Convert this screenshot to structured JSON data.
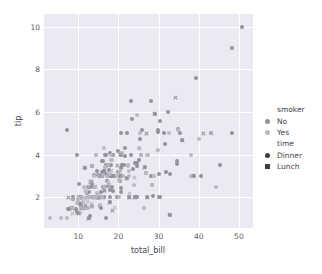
{
  "chart_data": {
    "type": "scatter",
    "title": "",
    "xlabel": "total_bill",
    "ylabel": "tip",
    "xlim": [
      1.5,
      53.5
    ],
    "ylim": [
      0.55,
      10.6
    ],
    "xticks": [
      10,
      20,
      30,
      40,
      50
    ],
    "yticks": [
      2,
      4,
      6,
      8,
      10
    ],
    "grid": true,
    "legend_position": "right",
    "hue": "smoker",
    "style": "time",
    "colors": {
      "No": "#92929f",
      "Yes": "#b9b9c4",
      "marker_dark": "#3d3d46",
      "panel_background": "#eaeaf2",
      "grid_line": "#ffffff",
      "text": "#44444c"
    },
    "legend": {
      "groups": [
        {
          "title": "smoker",
          "entries": [
            {
              "label": "No",
              "marker": "circle",
              "color": "#92929f"
            },
            {
              "label": "Yes",
              "marker": "circle",
              "color": "#b9b9c4"
            }
          ]
        },
        {
          "title": "time",
          "entries": [
            {
              "label": "Dinner",
              "marker": "circle",
              "color": "#3d3d46"
            },
            {
              "label": "Lunch",
              "marker": "x",
              "color": "#3d3d46"
            }
          ]
        }
      ]
    },
    "series": [
      {
        "name": "No / Dinner",
        "smoker": "No",
        "time": "Dinner",
        "marker": "circle",
        "color": "#92929f",
        "points": [
          [
            16.99,
            1.01
          ],
          [
            10.34,
            1.66
          ],
          [
            21.01,
            3.5
          ],
          [
            23.68,
            3.31
          ],
          [
            24.59,
            3.61
          ],
          [
            25.29,
            4.71
          ],
          [
            8.77,
            2.0
          ],
          [
            26.88,
            3.12
          ],
          [
            15.04,
            1.96
          ],
          [
            14.78,
            3.23
          ],
          [
            10.27,
            1.71
          ],
          [
            35.26,
            5.0
          ],
          [
            15.42,
            1.57
          ],
          [
            18.43,
            3.0
          ],
          [
            14.83,
            3.02
          ],
          [
            21.58,
            3.92
          ],
          [
            10.33,
            1.67
          ],
          [
            16.29,
            3.71
          ],
          [
            16.97,
            3.5
          ],
          [
            20.65,
            3.35
          ],
          [
            17.92,
            4.08
          ],
          [
            20.29,
            2.75
          ],
          [
            15.77,
            2.23
          ],
          [
            39.42,
            7.58
          ],
          [
            19.82,
            3.18
          ],
          [
            17.81,
            2.34
          ],
          [
            13.37,
            2.0
          ],
          [
            12.69,
            2.0
          ],
          [
            21.7,
            4.3
          ],
          [
            9.55,
            1.45
          ],
          [
            18.35,
            2.5
          ],
          [
            15.06,
            3.0
          ],
          [
            20.69,
            2.45
          ],
          [
            17.78,
            3.27
          ],
          [
            24.06,
            3.6
          ],
          [
            16.31,
            2.0
          ],
          [
            16.93,
            3.07
          ],
          [
            18.69,
            2.31
          ],
          [
            31.27,
            5.0
          ],
          [
            16.04,
            3.71
          ],
          [
            17.46,
            2.54
          ],
          [
            13.94,
            3.06
          ],
          [
            9.68,
            1.32
          ],
          [
            30.4,
            5.6
          ],
          [
            18.29,
            3.0
          ],
          [
            22.23,
            5.0
          ],
          [
            32.4,
            6.0
          ],
          [
            28.55,
            2.05
          ],
          [
            18.04,
            3.0
          ],
          [
            12.54,
            2.5
          ],
          [
            10.29,
            2.6
          ],
          [
            34.81,
            5.2
          ],
          [
            25.71,
            4.0
          ],
          [
            17.31,
            3.5
          ],
          [
            29.93,
            5.07
          ],
          [
            14.07,
            2.5
          ],
          [
            13.13,
            2.0
          ],
          [
            17.26,
            2.74
          ],
          [
            24.55,
            2.0
          ],
          [
            19.77,
            2.0
          ],
          [
            29.85,
            5.14
          ],
          [
            48.17,
            5.0
          ],
          [
            25.0,
            3.75
          ],
          [
            13.39,
            2.61
          ],
          [
            16.49,
            2.0
          ],
          [
            21.5,
            3.5
          ],
          [
            12.66,
            2.5
          ],
          [
            16.21,
            2.0
          ],
          [
            13.81,
            2.0
          ],
          [
            17.51,
            3.0
          ],
          [
            24.52,
            3.48
          ],
          [
            20.76,
            2.24
          ],
          [
            31.71,
            4.5
          ],
          [
            10.59,
            1.61
          ],
          [
            10.63,
            2.0
          ],
          [
            50.81,
            10.0
          ],
          [
            15.81,
            3.16
          ],
          [
            7.25,
            5.15
          ],
          [
            31.85,
            3.18
          ],
          [
            16.82,
            4.0
          ],
          [
            32.9,
            3.11
          ],
          [
            17.89,
            2.0
          ],
          [
            14.48,
            2.0
          ],
          [
            9.6,
            4.0
          ],
          [
            34.63,
            3.55
          ],
          [
            34.65,
            3.68
          ],
          [
            23.33,
            5.65
          ],
          [
            45.35,
            3.5
          ],
          [
            23.17,
            6.5
          ],
          [
            40.55,
            3.0
          ],
          [
            20.69,
            5.0
          ],
          [
            20.9,
            3.5
          ],
          [
            30.46,
            2.0
          ],
          [
            18.15,
            3.5
          ],
          [
            23.1,
            4.0
          ],
          [
            15.69,
            1.5
          ],
          [
            19.81,
            4.19
          ],
          [
            28.44,
            2.56
          ],
          [
            15.48,
            2.02
          ],
          [
            16.58,
            4.0
          ],
          [
            7.56,
            1.44
          ],
          [
            10.34,
            2.0
          ],
          [
            43.11,
            5.0
          ],
          [
            13.0,
            2.0
          ],
          [
            13.51,
            2.0
          ],
          [
            18.71,
            4.0
          ],
          [
            12.74,
            2.01
          ],
          [
            13.0,
            2.0
          ],
          [
            16.4,
            2.5
          ],
          [
            20.53,
            4.0
          ],
          [
            16.47,
            3.23
          ],
          [
            26.59,
            3.41
          ],
          [
            38.73,
            3.0
          ],
          [
            24.27,
            2.03
          ],
          [
            12.76,
            2.23
          ],
          [
            30.06,
            2.0
          ],
          [
            25.89,
            5.16
          ],
          [
            48.33,
            9.0
          ],
          [
            13.27,
            2.5
          ],
          [
            28.17,
            6.5
          ],
          [
            12.9,
            1.1
          ],
          [
            28.15,
            3.0
          ],
          [
            11.59,
            1.5
          ],
          [
            7.74,
            1.44
          ],
          [
            30.14,
            3.09
          ],
          [
            12.16,
            2.2
          ],
          [
            13.42,
            3.48
          ],
          [
            8.58,
            1.92
          ],
          [
            15.98,
            3.0
          ],
          [
            13.42,
            1.58
          ],
          [
            16.27,
            2.5
          ],
          [
            10.09,
            2.0
          ],
          [
            20.45,
            3.0
          ],
          [
            13.28,
            2.72
          ],
          [
            22.12,
            2.88
          ],
          [
            24.01,
            2.0
          ],
          [
            15.69,
            3.0
          ],
          [
            11.61,
            3.39
          ],
          [
            10.77,
            1.47
          ],
          [
            15.53,
            3.0
          ],
          [
            10.07,
            1.25
          ],
          [
            12.6,
            1.0
          ],
          [
            32.83,
            1.17
          ],
          [
            35.83,
            4.67
          ],
          [
            29.03,
            5.92
          ],
          [
            27.18,
            2.0
          ],
          [
            22.67,
            2.0
          ],
          [
            17.82,
            1.75
          ],
          [
            18.78,
            3.0
          ]
        ]
      },
      {
        "name": "Yes / Dinner",
        "smoker": "Yes",
        "time": "Dinner",
        "marker": "circle",
        "color": "#b9b9c4",
        "points": [
          [
            38.01,
            3.0
          ],
          [
            11.24,
            1.76
          ],
          [
            20.29,
            3.21
          ],
          [
            13.81,
            2.0
          ],
          [
            11.02,
            1.98
          ],
          [
            18.29,
            3.76
          ],
          [
            17.59,
            2.64
          ],
          [
            20.08,
            3.15
          ],
          [
            16.45,
            2.47
          ],
          [
            3.07,
            1.0
          ],
          [
            20.23,
            2.01
          ],
          [
            15.01,
            2.09
          ],
          [
            12.02,
            1.97
          ],
          [
            17.07,
            3.0
          ],
          [
            26.86,
            3.14
          ],
          [
            25.28,
            5.0
          ],
          [
            14.73,
            2.2
          ],
          [
            10.51,
            1.25
          ],
          [
            17.92,
            3.08
          ],
          [
            27.2,
            4.0
          ],
          [
            22.76,
            3.0
          ],
          [
            17.29,
            2.71
          ],
          [
            19.44,
            3.0
          ],
          [
            16.66,
            3.4
          ],
          [
            10.07,
            1.83
          ],
          [
            32.68,
            5.0
          ],
          [
            15.98,
            2.03
          ],
          [
            34.83,
            5.17
          ],
          [
            13.03,
            2.0
          ],
          [
            18.28,
            4.0
          ],
          [
            24.71,
            5.85
          ],
          [
            21.16,
            3.0
          ],
          [
            28.97,
            3.0
          ],
          [
            22.49,
            3.5
          ],
          [
            5.75,
            1.0
          ],
          [
            16.32,
            4.3
          ],
          [
            22.75,
            3.25
          ],
          [
            40.17,
            4.73
          ],
          [
            27.28,
            4.0
          ],
          [
            12.03,
            1.5
          ],
          [
            21.01,
            3.0
          ],
          [
            12.46,
            1.5
          ],
          [
            11.35,
            2.5
          ],
          [
            15.38,
            3.0
          ],
          [
            44.3,
            2.5
          ],
          [
            22.42,
            3.48
          ],
          [
            20.92,
            4.08
          ],
          [
            15.36,
            1.64
          ],
          [
            20.49,
            4.06
          ],
          [
            25.21,
            4.29
          ],
          [
            18.24,
            3.76
          ],
          [
            14.31,
            4.0
          ],
          [
            14.0,
            3.0
          ],
          [
            7.25,
            1.0
          ],
          [
            38.07,
            4.0
          ],
          [
            23.95,
            2.55
          ],
          [
            25.71,
            4.0
          ],
          [
            17.31,
            3.5
          ],
          [
            29.8,
            4.2
          ],
          [
            26.41,
            1.5
          ],
          [
            15.06,
            3.0
          ],
          [
            28.44,
            2.56
          ],
          [
            15.95,
            2.0
          ],
          [
            16.43,
            2.3
          ],
          [
            14.31,
            4.0
          ],
          [
            9.78,
            1.73
          ],
          [
            20.27,
            2.83
          ],
          [
            14.07,
            2.5
          ]
        ]
      },
      {
        "name": "No / Lunch",
        "smoker": "No",
        "time": "Lunch",
        "marker": "x",
        "color": "#92929f",
        "points": [
          [
            13.42,
            1.58
          ],
          [
            16.27,
            2.5
          ],
          [
            10.09,
            2.0
          ],
          [
            20.45,
            3.0
          ],
          [
            13.28,
            2.72
          ],
          [
            22.12,
            2.88
          ],
          [
            24.01,
            2.0
          ],
          [
            15.69,
            3.0
          ],
          [
            11.61,
            3.39
          ],
          [
            10.77,
            1.47
          ],
          [
            15.53,
            3.0
          ],
          [
            10.07,
            1.25
          ],
          [
            12.6,
            1.0
          ],
          [
            32.83,
            1.17
          ],
          [
            35.83,
            4.67
          ],
          [
            29.03,
            5.92
          ],
          [
            27.18,
            2.0
          ],
          [
            22.67,
            2.0
          ],
          [
            17.82,
            1.75
          ],
          [
            18.78,
            3.0
          ],
          [
            7.51,
            2.0
          ],
          [
            8.52,
            1.48
          ],
          [
            10.33,
            2.0
          ],
          [
            14.15,
            2.0
          ],
          [
            16.0,
            2.0
          ],
          [
            13.16,
            2.75
          ],
          [
            17.47,
            3.5
          ],
          [
            34.3,
            6.7
          ],
          [
            41.19,
            5.0
          ],
          [
            27.05,
            5.0
          ],
          [
            16.43,
            2.3
          ],
          [
            8.35,
            1.5
          ],
          [
            18.64,
            1.36
          ],
          [
            11.87,
            1.63
          ],
          [
            19.67,
            3.48
          ],
          [
            11.17,
            1.5
          ],
          [
            20.53,
            4.0
          ],
          [
            16.47,
            3.23
          ],
          [
            26.59,
            3.41
          ],
          [
            38.73,
            3.0
          ]
        ]
      },
      {
        "name": "Yes / Lunch",
        "smoker": "Yes",
        "time": "Lunch",
        "marker": "x",
        "color": "#b9b9c4",
        "points": [
          [
            12.16,
            2.2
          ],
          [
            13.42,
            3.48
          ],
          [
            8.58,
            1.92
          ],
          [
            15.98,
            3.0
          ],
          [
            13.42,
            1.58
          ],
          [
            16.27,
            2.5
          ],
          [
            10.09,
            2.0
          ],
          [
            11.69,
            2.31
          ],
          [
            13.81,
            2.0
          ],
          [
            10.65,
            1.5
          ],
          [
            12.43,
            1.8
          ],
          [
            24.08,
            2.92
          ],
          [
            11.69,
            2.31
          ],
          [
            13.42,
            1.68
          ],
          [
            14.26,
            2.5
          ],
          [
            15.95,
            2.0
          ],
          [
            12.48,
            2.52
          ],
          [
            29.8,
            4.2
          ],
          [
            8.52,
            1.48
          ],
          [
            14.52,
            2.0
          ],
          [
            11.38,
            2.0
          ],
          [
            22.82,
            2.18
          ],
          [
            19.08,
            1.5
          ],
          [
            20.27,
            2.83
          ],
          [
            11.17,
            1.5
          ],
          [
            12.26,
            2.0
          ],
          [
            18.26,
            3.25
          ],
          [
            8.51,
            1.25
          ],
          [
            10.33,
            2.0
          ],
          [
            14.15,
            2.0
          ],
          [
            16.0,
            2.0
          ],
          [
            13.16,
            2.75
          ],
          [
            17.47,
            3.5
          ],
          [
            43.11,
            5.0
          ],
          [
            25.21,
            4.29
          ]
        ]
      }
    ]
  }
}
